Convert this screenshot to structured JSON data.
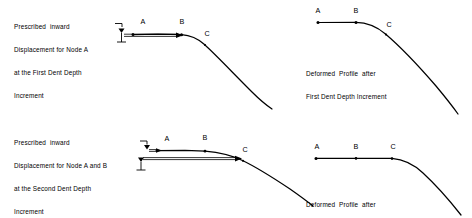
{
  "figure": {
    "background_color": "#ffffff",
    "line_color": "#000000"
  },
  "panels": {
    "top_left": {
      "name": "prescribed-displacement-first-increment",
      "caption": {
        "lines": [
          "Prescribed  inward",
          "Displacement for Node A",
          "at the First Dent Depth",
          "Increment"
        ]
      },
      "node_labels": [
        "A",
        "B",
        "C"
      ],
      "nodes": [
        {
          "label": "A",
          "x": 143,
          "y": 33
        },
        {
          "label": "B",
          "x": 182,
          "y": 32
        },
        {
          "label": "C",
          "x": 204,
          "y": 43
        }
      ]
    },
    "top_right": {
      "name": "deformed-profile-first-increment",
      "caption": {
        "lines": [
          "Deformed  Profile  after",
          "First Dent Depth Increment"
        ]
      },
      "node_labels": [
        "A",
        "B",
        "C"
      ],
      "nodes": [
        {
          "label": "A",
          "x": 318,
          "y": 22
        },
        {
          "label": "B",
          "x": 356,
          "y": 22
        },
        {
          "label": "C",
          "x": 385,
          "y": 31
        }
      ]
    },
    "bottom_left": {
      "name": "prescribed-displacement-second-increment",
      "caption": {
        "lines": [
          "Prescribed  inward",
          "Displacement for Node A and B",
          "at the Second Dent Depth",
          "Increment"
        ]
      },
      "node_labels": [
        "A",
        "B",
        "C"
      ],
      "nodes": [
        {
          "label": "A",
          "x": 167,
          "y": 148
        },
        {
          "label": "B",
          "x": 204,
          "y": 148
        },
        {
          "label": "C",
          "x": 241,
          "y": 158
        }
      ]
    },
    "bottom_right": {
      "name": "deformed-profile-second-increment",
      "caption": {
        "lines": [
          "Deformed  Profile  after",
          "Second Dent Depth Increment"
        ]
      },
      "node_labels": [
        "A",
        "B",
        "C"
      ],
      "nodes": [
        {
          "label": "A",
          "x": 318,
          "y": 158
        },
        {
          "label": "B",
          "x": 356,
          "y": 158
        },
        {
          "label": "C",
          "x": 393,
          "y": 158
        }
      ]
    }
  },
  "labels": {
    "a": "A",
    "b": "B",
    "c": "C"
  }
}
